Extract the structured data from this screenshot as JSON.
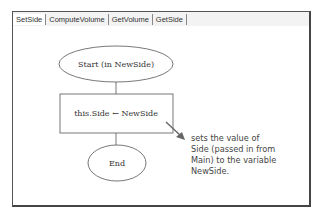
{
  "tabs": [
    {
      "label": "SetSide",
      "active": true
    },
    {
      "label": "ComputeVolume",
      "active": false
    },
    {
      "label": "GetVolume",
      "active": false
    },
    {
      "label": "GetSide",
      "active": false
    }
  ],
  "flowchart": {
    "start_label": "Start (in NewSide)",
    "process_label": "this.Side ← NewSide",
    "end_label": "End"
  },
  "annotation": {
    "lines": [
      "sets the value of",
      "Side (passed in from",
      "Main) to the variable",
      "NewSide."
    ]
  },
  "colors": {
    "stroke": "#555555",
    "arrow": "#666666",
    "annotation_text": "#444444"
  }
}
